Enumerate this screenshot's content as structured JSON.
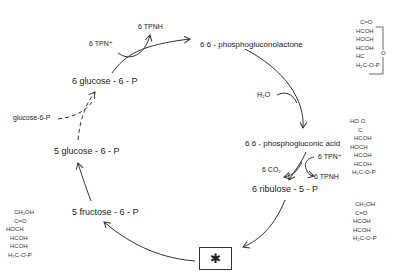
{
  "diagram": {
    "type": "metabolic cycle (pentose phosphate pathway)",
    "nodes": {
      "glucose6p_6": "6  glucose - 6 - P",
      "phosphogluconolactone": "6  6 - phosphogluconolactone",
      "phosphogluconic_acid": "6 6 - phosphogluconic  acid",
      "ribulose5p": "6  ribulose - 5 - P",
      "fructose6p": "5  fructose - 6 - P",
      "glucose6p_5": "5  glucose - 6 - P",
      "glucose6p_input": "glucose-6-P"
    },
    "cofactors": {
      "tpn_plus_1": "6 TPN⁺",
      "tpnh_1": "6 TPNH",
      "h2o": "H₂O",
      "tpn_plus_2": "6 TPN⁺",
      "co2": "6 CO₂",
      "tpnh_2": "6 TPNH"
    },
    "box_symbol": "✱",
    "structures": {
      "lactone": [
        "C=O",
        "HCOH",
        "HOCH",
        "HCOH",
        "HC",
        "H₂C-O-P"
      ],
      "lactone_ring_atom": "O",
      "acid": [
        "HO  O",
        "C",
        "HCOH",
        "HOCH",
        "HCOH",
        "HCOH",
        "H₂C-O-P"
      ],
      "ribulose": [
        "CH₂OH",
        "C=O",
        "HCOH",
        "HCOH",
        "H₂C-O-P"
      ],
      "fructose": [
        "CH₂OH",
        "C=O",
        "HOCH",
        "HCOH",
        "HCOH",
        "H₂C-O-P"
      ]
    }
  }
}
